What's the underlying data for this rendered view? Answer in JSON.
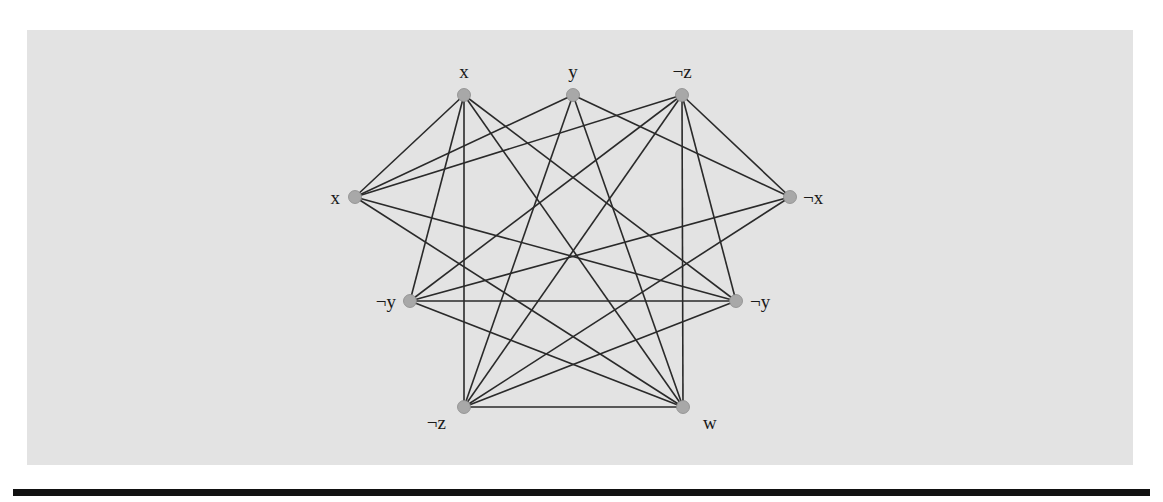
{
  "diagram": {
    "type": "graph",
    "node_color": "#a8a8a8",
    "edge_color": "#2a2a2a",
    "background_color": "#e3e3e3",
    "nodes": [
      {
        "id": "n_x_top",
        "label": "x",
        "x": 464,
        "y": 95,
        "lx": 464,
        "ly": 78,
        "anchor": "middle"
      },
      {
        "id": "n_y_top",
        "label": "y",
        "x": 573,
        "y": 95,
        "lx": 573,
        "ly": 78,
        "anchor": "middle"
      },
      {
        "id": "n_nz_top",
        "label": "¬z",
        "x": 682,
        "y": 95,
        "lx": 682,
        "ly": 78,
        "anchor": "middle"
      },
      {
        "id": "n_x_left",
        "label": "x",
        "x": 355,
        "y": 197,
        "lx": 340,
        "ly": 204,
        "anchor": "end"
      },
      {
        "id": "n_nx_right",
        "label": "¬x",
        "x": 790,
        "y": 197,
        "lx": 803,
        "ly": 204,
        "anchor": "start"
      },
      {
        "id": "n_ny_left",
        "label": "¬y",
        "x": 410,
        "y": 301,
        "lx": 396,
        "ly": 308,
        "anchor": "end"
      },
      {
        "id": "n_ny_right",
        "label": "¬y",
        "x": 736,
        "y": 301,
        "lx": 750,
        "ly": 308,
        "anchor": "start"
      },
      {
        "id": "n_nz_bot",
        "label": "¬z",
        "x": 464,
        "y": 407,
        "lx": 446,
        "ly": 429,
        "anchor": "end"
      },
      {
        "id": "n_w_bot",
        "label": "w",
        "x": 683,
        "y": 407,
        "lx": 703,
        "ly": 429,
        "anchor": "start"
      }
    ],
    "edges": [
      [
        "n_x_top",
        "n_x_left"
      ],
      [
        "n_x_top",
        "n_ny_left"
      ],
      [
        "n_x_top",
        "n_nz_bot"
      ],
      [
        "n_x_top",
        "n_ny_right"
      ],
      [
        "n_x_top",
        "n_w_bot"
      ],
      [
        "n_y_top",
        "n_x_left"
      ],
      [
        "n_y_top",
        "n_nz_bot"
      ],
      [
        "n_y_top",
        "n_w_bot"
      ],
      [
        "n_y_top",
        "n_nx_right"
      ],
      [
        "n_nz_top",
        "n_x_left"
      ],
      [
        "n_nz_top",
        "n_ny_left"
      ],
      [
        "n_nz_top",
        "n_nz_bot"
      ],
      [
        "n_nz_top",
        "n_w_bot"
      ],
      [
        "n_nz_top",
        "n_ny_right"
      ],
      [
        "n_nz_top",
        "n_nx_right"
      ],
      [
        "n_x_left",
        "n_ny_right"
      ],
      [
        "n_x_left",
        "n_w_bot"
      ],
      [
        "n_nx_right",
        "n_ny_left"
      ],
      [
        "n_nx_right",
        "n_nz_bot"
      ],
      [
        "n_ny_left",
        "n_ny_right"
      ],
      [
        "n_ny_left",
        "n_w_bot"
      ],
      [
        "n_ny_right",
        "n_nz_bot"
      ],
      [
        "n_nz_bot",
        "n_w_bot"
      ]
    ]
  }
}
